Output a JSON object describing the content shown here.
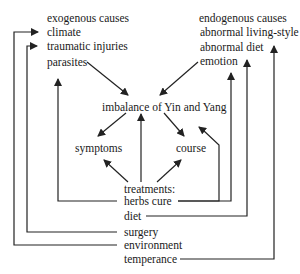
{
  "exogenous": {
    "heading": "exogenous causes",
    "items": [
      "climate",
      "traumatic injuries",
      "parasites"
    ]
  },
  "endogenous": {
    "heading": "endogenous causes",
    "items": [
      "abnormal living-style",
      "abnormal diet",
      "emotion"
    ]
  },
  "center": {
    "imbalance": "imbalance of Yin and Yang",
    "symptoms": "symptoms",
    "course": "course"
  },
  "treatments": {
    "heading": "treatments:",
    "items": [
      "herbs cure",
      "diet",
      "surgery",
      "environment",
      "temperance"
    ]
  },
  "colors": {
    "line": "#222222",
    "text": "#1a1a1a",
    "background": "#ffffff"
  }
}
